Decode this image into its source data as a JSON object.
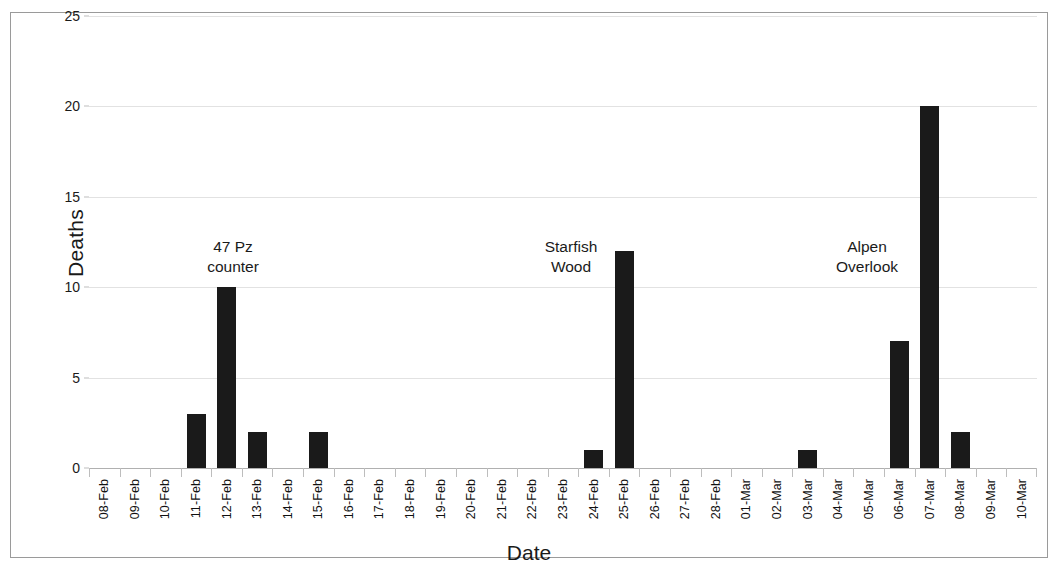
{
  "chart_data": {
    "type": "bar",
    "title": "",
    "xlabel": "Date",
    "ylabel": "Deaths",
    "ylim": [
      0,
      25
    ],
    "yticks": [
      0,
      5,
      10,
      15,
      20,
      25
    ],
    "grid": true,
    "legend": "none",
    "bar_color": "#1a1a1a",
    "categories": [
      "08-Feb",
      "09-Feb",
      "10-Feb",
      "11-Feb",
      "12-Feb",
      "13-Feb",
      "14-Feb",
      "15-Feb",
      "16-Feb",
      "17-Feb",
      "18-Feb",
      "19-Feb",
      "20-Feb",
      "21-Feb",
      "22-Feb",
      "23-Feb",
      "24-Feb",
      "25-Feb",
      "26-Feb",
      "27-Feb",
      "28-Feb",
      "01-Mar",
      "02-Mar",
      "03-Mar",
      "04-Mar",
      "05-Mar",
      "06-Mar",
      "07-Mar",
      "08-Mar",
      "09-Mar",
      "10-Mar"
    ],
    "values": [
      0,
      0,
      0,
      3,
      10,
      2,
      0,
      2,
      0,
      0,
      0,
      0,
      0,
      0,
      0,
      0,
      1,
      12,
      0,
      0,
      0,
      0,
      0,
      1,
      0,
      0,
      7,
      20,
      2,
      0,
      0
    ],
    "annotations": [
      {
        "text": "47 Pz\ncounter",
        "near_category": "12-Feb"
      },
      {
        "text": "Starfish\nWood",
        "near_category": "25-Feb"
      },
      {
        "text": "Alpen\nOverlook",
        "near_category": "07-Mar"
      }
    ]
  }
}
